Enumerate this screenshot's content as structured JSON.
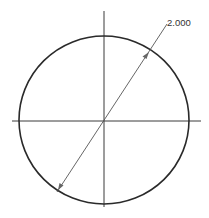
{
  "drawing": {
    "type": "circle-diameter-dimension",
    "circle": {
      "cx": 104,
      "cy": 120,
      "rx": 85,
      "ry": 84,
      "stroke": "#2a2a2a"
    },
    "centerlines": {
      "horizontal": {
        "x1": 12,
        "x2": 201,
        "y": 121
      },
      "vertical": {
        "x": 104,
        "y1": 11,
        "y2": 207
      },
      "stroke": "#3a3a3a"
    },
    "dimension": {
      "label": "2.000",
      "leader": {
        "x1": 57,
        "y1": 192,
        "x2": 167,
        "y2": 24
      },
      "arrow_end_1": {
        "x": 61,
        "y": 185
      },
      "arrow_end_2": {
        "x": 146,
        "y": 56
      },
      "stroke": "#555555"
    }
  }
}
